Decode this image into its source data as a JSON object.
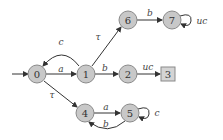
{
  "diagram": {
    "type": "automaton",
    "initial_state": "0",
    "states": [
      {
        "id": "0",
        "label": "0",
        "shape": "circle"
      },
      {
        "id": "1",
        "label": "1",
        "shape": "circle"
      },
      {
        "id": "2",
        "label": "2",
        "shape": "circle"
      },
      {
        "id": "3",
        "label": "3",
        "shape": "square"
      },
      {
        "id": "4",
        "label": "4",
        "shape": "circle"
      },
      {
        "id": "5",
        "label": "5",
        "shape": "circle"
      },
      {
        "id": "6",
        "label": "6",
        "shape": "circle"
      },
      {
        "id": "7",
        "label": "7",
        "shape": "circle"
      }
    ],
    "transitions": [
      {
        "from": "0",
        "to": "1",
        "label": "a"
      },
      {
        "from": "1",
        "to": "0",
        "label": "c"
      },
      {
        "from": "1",
        "to": "6",
        "label": "τ"
      },
      {
        "from": "1",
        "to": "2",
        "label": "b"
      },
      {
        "from": "2",
        "to": "3",
        "label": "uc"
      },
      {
        "from": "6",
        "to": "7",
        "label": "b"
      },
      {
        "from": "7",
        "to": "7",
        "label": "uc"
      },
      {
        "from": "0",
        "to": "4",
        "label": "τ"
      },
      {
        "from": "4",
        "to": "5",
        "label": "a"
      },
      {
        "from": "5",
        "to": "4",
        "label": "b"
      },
      {
        "from": "5",
        "to": "5",
        "label": "c"
      }
    ]
  },
  "labels": {
    "s0": "0",
    "s1": "1",
    "s2": "2",
    "s3": "3",
    "s4": "4",
    "s5": "5",
    "s6": "6",
    "s7": "7",
    "e01": "a",
    "e10": "c",
    "e16": "τ",
    "e12": "b",
    "e23": "uc",
    "e67": "b",
    "e77": "uc",
    "e04": "τ",
    "e45": "a",
    "e54": "b",
    "e55": "c"
  },
  "colors": {
    "node_fill": "#c8c8c8",
    "node_stroke": "#8a8a8a",
    "edge": "#333333"
  }
}
